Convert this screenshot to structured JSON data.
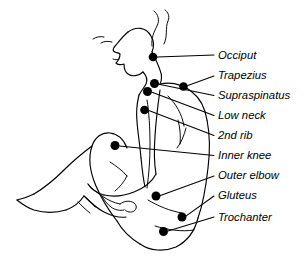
{
  "diagram": {
    "line_color": "#000000",
    "dot_color": "#000000",
    "background_color": "#ffffff"
  },
  "points": [
    {
      "id": "occiput",
      "label": "Occiput",
      "dot": {
        "x": 153.0,
        "y": 57.0,
        "r": 4.3
      },
      "leader": "M 157.3 57.0 L 214.0 55.0",
      "label_pos": {
        "x": 218.0,
        "y": 58.5
      }
    },
    {
      "id": "trapezius",
      "label": "Trapezius",
      "dot": {
        "x": 183.5,
        "y": 86.5,
        "r": 4.3
      },
      "leader": "M 187.8 85.5 L 214.0 76.0",
      "label_pos": {
        "x": 218.0,
        "y": 79.0
      }
    },
    {
      "id": "supraspinatus",
      "label": "Supraspinatus",
      "dot": {
        "x": 154.5,
        "y": 83.5,
        "r": 4.5
      },
      "leader": "M 158.8 84.3 L 214.0 95.5",
      "label_pos": {
        "x": 218.0,
        "y": 99.0
      }
    },
    {
      "id": "low-neck",
      "label": "Low neck",
      "dot": {
        "x": 147.5,
        "y": 91.5,
        "r": 4.5
      },
      "leader": "M 152.0 92.3 L 214.0 115.5",
      "label_pos": {
        "x": 218.0,
        "y": 119.0
      }
    },
    {
      "id": "2nd-rib",
      "label": "2nd rib",
      "dot": {
        "x": 144.5,
        "y": 110.0,
        "r": 4.3
      },
      "leader": "M 148.8 110.6 L 214.0 135.5",
      "label_pos": {
        "x": 218.0,
        "y": 139.0
      }
    },
    {
      "id": "inner-knee",
      "label": "Inner knee",
      "dot": {
        "x": 115.0,
        "y": 145.5,
        "r": 4.5
      },
      "leader": "M 119.5 145.9 L 214.0 155.5",
      "label_pos": {
        "x": 218.0,
        "y": 159.0
      }
    },
    {
      "id": "outer-elbow",
      "label": "Outer elbow",
      "dot": {
        "x": 156.0,
        "y": 196.0,
        "r": 4.5
      },
      "leader": "M 160.4 195.4 L 214.0 176.0",
      "label_pos": {
        "x": 218.0,
        "y": 179.0
      }
    },
    {
      "id": "gluteus",
      "label": "Gluteus",
      "dot": {
        "x": 182.0,
        "y": 217.0,
        "r": 4.5
      },
      "leader": "M 186.2 215.9 L 214.0 196.0",
      "label_pos": {
        "x": 218.0,
        "y": 199.0
      }
    },
    {
      "id": "trochanter",
      "label": "Trochanter",
      "dot": {
        "x": 163.5,
        "y": 231.5,
        "r": 4.5
      },
      "leader": "M 168.0 231.0 L 214.0 217.0",
      "label_pos": {
        "x": 218.0,
        "y": 220.5
      }
    }
  ],
  "body_outline": {
    "hair_top": "M 152 46 C 151 38, 154 32, 157 26 C 160 20, 158 14, 154 11",
    "hair_strand_2": "M 164 44 C 168 36, 165 28, 168 21 C 170 16, 168 12, 165 10",
    "forehead": "M 128 32 C 136 26, 146 27, 151 36 C 154 41, 154 47, 152 52",
    "face_profile": "M 128 32 C 124 35, 120 40, 116 45 C 113 48, 112 51, 115 52 C 117 53, 119 53, 120 54 C 120 58, 118 61, 116 63 C 118 65, 121 65, 124 64 C 124 68, 125 72, 128 74 C 132 77, 139 76, 143 72",
    "eyebrow": "M 104 37 C 100 36, 96 37, 93 39",
    "nose_brow": "M 112 42 C 108 41, 104 41, 101 43",
    "lip": "M 119 59 C 117 60, 115 60, 113 59",
    "jaw_neck": "M 143 72 C 146 75, 148 79, 146 84 C 144 88, 141 91, 139 95",
    "neck_back": "M 152 52 C 155 58, 158 64, 160 70 C 162 75, 162 80, 160 84",
    "shoulder_back": "M 160 84 C 170 82, 182 84, 192 92 C 200 98, 205 108, 207 120",
    "back_curve": "M 207 120 C 210 135, 210 152, 208 168 C 206 186, 203 204, 198 218",
    "buttock": "M 198 218 C 195 230, 188 241, 176 247 C 164 252, 150 251, 140 244",
    "thigh_under": "M 140 244 C 130 238, 122 230, 117 221",
    "chest_front": "M 139 95 C 137 103, 136 112, 137 122 C 138 134, 140 146, 141 158",
    "abdomen": "M 141 158 C 142 168, 143 178, 145 187",
    "torso_mid_line": "M 147 100 C 149 112, 150 128, 150 144 C 150 160, 149 174, 147 188",
    "arm_upper": "M 160 90 C 158 104, 156 120, 155 136 C 154 150, 154 162, 156 174",
    "arm_lower": "M 156 174 C 152 182, 144 188, 134 192 C 124 196, 113 197, 104 195",
    "forearm": "M 104 195 C 97 193, 91 189, 88 184",
    "hand_detail_1": "M 88 184 C 91 188, 96 192, 102 196 C 108 200, 114 203, 120 204",
    "hand_detail_2": "M 102 196 C 104 200, 107 204, 111 207 C 115 210, 120 211, 124 210",
    "hand_thumb": "M 120 204 C 124 201, 130 200, 134 203 C 137 205, 137 209, 134 211 C 131 213, 127 212, 125 210",
    "knee_thigh_top": "M 117 221 C 110 212, 102 200, 96 186 C 90 172, 88 158, 92 146 C 95 137, 102 132, 110 133 C 118 134, 124 140, 127 148",
    "shin": "M 92 146 C 84 152, 74 160, 64 170 C 54 180, 44 188, 34 194",
    "foot_top": "M 34 194 C 28 197, 22 199, 17 200",
    "foot_sole": "M 17 200 C 22 204, 28 208, 34 210 C 44 213, 56 213, 66 210",
    "ankle_heel": "M 66 210 C 74 207, 80 202, 84 196",
    "calf_back": "M 84 196 C 90 202, 96 208, 104 212 C 112 216, 120 218, 126 217",
    "shoe_line_1": "M 84 196 C 88 199, 92 203, 95 207",
    "shoe_line_2": "M 78 202 C 82 206, 86 210, 90 213",
    "knee_crease": "M 110 162 C 116 166, 122 170, 127 176",
    "calf_crease": "M 127 176 C 124 182, 120 187, 115 191",
    "rib_hint_1": "M 178 120 C 180 128, 181 136, 180 144",
    "rib_hint_2": "M 186 128 C 184 136, 181 143, 177 148",
    "back_crease": "M 148 200 C 158 206, 170 211, 182 213",
    "gluteal_crease": "M 155 226 C 168 230, 182 232, 194 230",
    "scapula_line": "M 168 96 C 176 104, 182 114, 184 126"
  }
}
